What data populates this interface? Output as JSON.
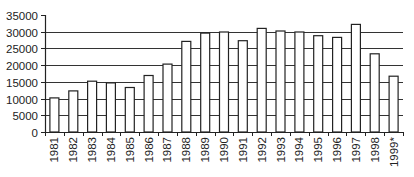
{
  "chart_data": {
    "type": "bar",
    "title": "",
    "xlabel": "",
    "ylabel": "",
    "categories": [
      "1981",
      "1982",
      "1983",
      "1984",
      "1985",
      "1986",
      "1987",
      "1988",
      "1989",
      "1990",
      "1991",
      "1992",
      "1993",
      "1994",
      "1995",
      "1996",
      "1997",
      "1998",
      "1999*"
    ],
    "values": [
      10200,
      12300,
      15200,
      14700,
      13300,
      16900,
      20300,
      27100,
      29600,
      29900,
      27300,
      31000,
      30200,
      29900,
      28800,
      28300,
      32200,
      23400,
      16700
    ],
    "ylim": [
      0,
      35000
    ],
    "yticks": [
      "0",
      "5000",
      "10000",
      "15000",
      "20000",
      "25000",
      "30000",
      "35000"
    ],
    "ytick_values": [
      0,
      5000,
      10000,
      15000,
      20000,
      25000,
      30000,
      35000
    ],
    "grid": true,
    "legend": null,
    "colors": {
      "bar_fill": "#ffffff",
      "bar_stroke": "#222222",
      "grid": "#333333",
      "axis": "#222222"
    }
  }
}
